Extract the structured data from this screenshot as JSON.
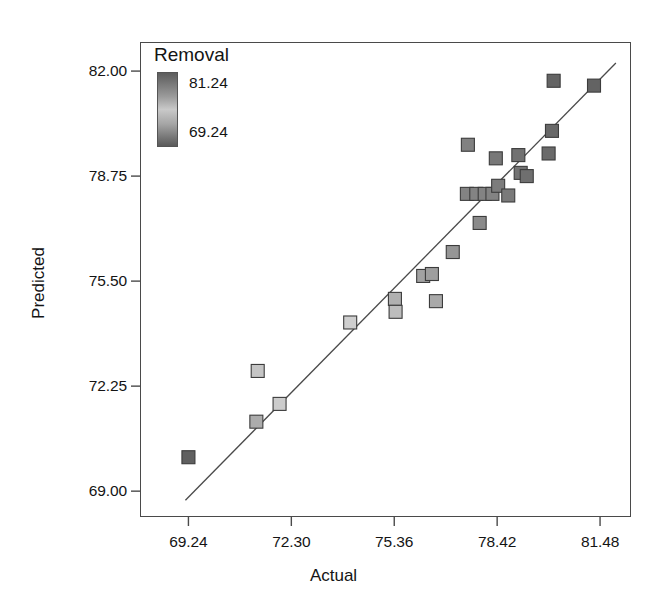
{
  "chart_data": {
    "type": "scatter",
    "title": "",
    "xlabel": "Actual",
    "ylabel": "Predicted",
    "xlim": [
      67.8,
      82.4
    ],
    "ylim": [
      68.2,
      82.9
    ],
    "grid": false,
    "xticks": [
      "69.24",
      "72.30",
      "75.36",
      "78.42",
      "81.48"
    ],
    "xtick_values": [
      69.24,
      72.3,
      75.36,
      78.42,
      81.48
    ],
    "yticks": [
      "82.00",
      "78.75",
      "75.50",
      "72.25",
      "69.00"
    ],
    "ytick_values": [
      82.0,
      78.75,
      75.5,
      72.25,
      69.0
    ],
    "legend": {
      "title": "Removal",
      "position": "inside-top-left",
      "type": "continuous-colorbar",
      "max_label": "81.24",
      "min_label": "69.24",
      "max_value": 81.24,
      "min_value": 69.24
    },
    "reference_line": {
      "label": "fit-line",
      "x_start": 69.15,
      "y_start": 68.72,
      "x_end": 81.95,
      "y_end": 82.25,
      "color": "#4a4a4a"
    },
    "series": [
      {
        "name": "Removal",
        "marker": "square",
        "points": [
          {
            "x": 69.24,
            "y": 70.05,
            "shade": 69.6
          },
          {
            "x": 71.3,
            "y": 72.72,
            "shade": 74.1
          },
          {
            "x": 71.26,
            "y": 71.15,
            "shade": 73.0
          },
          {
            "x": 71.95,
            "y": 71.7,
            "shade": 74.4
          },
          {
            "x": 74.05,
            "y": 74.22,
            "shade": 76.4
          },
          {
            "x": 75.38,
            "y": 74.95,
            "shade": 77.8
          },
          {
            "x": 75.4,
            "y": 74.55,
            "shade": 77.2
          },
          {
            "x": 76.22,
            "y": 75.66,
            "shade": 78.4
          },
          {
            "x": 76.48,
            "y": 75.72,
            "shade": 78.6
          },
          {
            "x": 76.6,
            "y": 74.88,
            "shade": 78.1
          },
          {
            "x": 77.1,
            "y": 76.4,
            "shade": 79.0
          },
          {
            "x": 77.52,
            "y": 78.2,
            "shade": 79.8
          },
          {
            "x": 77.8,
            "y": 78.2,
            "shade": 79.8
          },
          {
            "x": 78.05,
            "y": 78.2,
            "shade": 79.8
          },
          {
            "x": 78.28,
            "y": 78.2,
            "shade": 79.8
          },
          {
            "x": 77.55,
            "y": 79.72,
            "shade": 79.9
          },
          {
            "x": 77.9,
            "y": 77.3,
            "shade": 79.5
          },
          {
            "x": 78.45,
            "y": 78.45,
            "shade": 80.1
          },
          {
            "x": 78.38,
            "y": 79.3,
            "shade": 80.3
          },
          {
            "x": 78.75,
            "y": 78.15,
            "shade": 80.2
          },
          {
            "x": 79.05,
            "y": 79.4,
            "shade": 80.6
          },
          {
            "x": 79.12,
            "y": 78.85,
            "shade": 80.5
          },
          {
            "x": 79.3,
            "y": 78.75,
            "shade": 80.7
          },
          {
            "x": 79.95,
            "y": 79.45,
            "shade": 80.9
          },
          {
            "x": 80.05,
            "y": 80.15,
            "shade": 81.0
          },
          {
            "x": 80.1,
            "y": 81.7,
            "shade": 81.2
          },
          {
            "x": 81.3,
            "y": 81.55,
            "shade": 81.24
          }
        ]
      }
    ]
  }
}
